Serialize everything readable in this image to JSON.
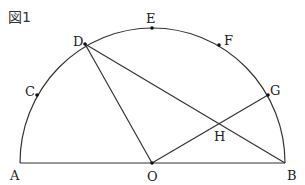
{
  "figure": {
    "title": "図1",
    "stroke_color": "#333333",
    "shape": "semicircle with center O, diameter AB",
    "points": {
      "A": {
        "label": "A",
        "x": 20,
        "y": 163
      },
      "O": {
        "label": "O",
        "x": 152,
        "y": 163
      },
      "B": {
        "label": "B",
        "x": 285,
        "y": 163
      },
      "C": {
        "label": "C",
        "x": 37,
        "y": 95
      },
      "D": {
        "label": "D",
        "x": 85,
        "y": 44
      },
      "E": {
        "label": "E",
        "x": 152,
        "y": 28
      },
      "F": {
        "label": "F",
        "x": 219,
        "y": 45
      },
      "G": {
        "label": "G",
        "x": 268,
        "y": 95
      },
      "H": {
        "label": "H",
        "x": 218,
        "y": 124
      }
    },
    "segments": [
      "AB",
      "DO",
      "DB",
      "OG"
    ]
  }
}
